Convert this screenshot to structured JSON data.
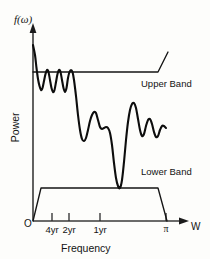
{
  "figure": {
    "background_color": "#fdfdfb",
    "ink_color": "#131313",
    "y_axis_label_top": "f(ω)",
    "y_axis_label": "Power",
    "x_axis_label": "Frequency",
    "x_axis_arrow_label": "W",
    "origin_label": "O"
  },
  "annotations": {
    "upper_band": "Upper Band",
    "lower_band": "Lower Band"
  },
  "chart_data": {
    "type": "line",
    "title": "",
    "subtitle": "",
    "xlabel": "Frequency",
    "ylabel": "Power",
    "y_axis_symbol": "f(ω)",
    "x_axis_symbol": "W",
    "grid": false,
    "legend_position": "inline-annotation",
    "xlim": [
      0,
      3.1416
    ],
    "ylim": [
      0,
      1
    ],
    "xticks": [
      {
        "label": "4yr",
        "x_px": 52
      },
      {
        "label": "2yr",
        "x_px": 69
      },
      {
        "label": "1yr",
        "x_px": 100
      },
      {
        "label": "π",
        "x_px": 166
      }
    ],
    "series": [
      {
        "name": "Power spectrum",
        "note": "Spectral density curve f(ω) with peaks at business-cycle frequencies",
        "points_px": [
          [
            33,
            45
          ],
          [
            35,
            55
          ],
          [
            36.5,
            68
          ],
          [
            38,
            79
          ],
          [
            39.5,
            86
          ],
          [
            41,
            90
          ],
          [
            42.5,
            88
          ],
          [
            44,
            81
          ],
          [
            45.5,
            74
          ],
          [
            47,
            70
          ],
          [
            48.5,
            72
          ],
          [
            50,
            80
          ],
          [
            51.5,
            88
          ],
          [
            53,
            92
          ],
          [
            54.5,
            90
          ],
          [
            56,
            82
          ],
          [
            57.5,
            74
          ],
          [
            59,
            70
          ],
          [
            60.5,
            72
          ],
          [
            62,
            80
          ],
          [
            63.5,
            88
          ],
          [
            65,
            92
          ],
          [
            66.5,
            88
          ],
          [
            68,
            78
          ],
          [
            69.5,
            72
          ],
          [
            71,
            70
          ],
          [
            72.5,
            72
          ],
          [
            74,
            80
          ],
          [
            76,
            96
          ],
          [
            78,
            115
          ],
          [
            80,
            130
          ],
          [
            82,
            139
          ],
          [
            84,
            141
          ],
          [
            86,
            138
          ],
          [
            88,
            130
          ],
          [
            90,
            121
          ],
          [
            92,
            115
          ],
          [
            94,
            112
          ],
          [
            96,
            113
          ],
          [
            98,
            120
          ],
          [
            100,
            127
          ],
          [
            102,
            129
          ],
          [
            104,
            128
          ],
          [
            106,
            127
          ],
          [
            108,
            128
          ],
          [
            110,
            133
          ],
          [
            112,
            145
          ],
          [
            114,
            163
          ],
          [
            116,
            178
          ],
          [
            118,
            186
          ],
          [
            120,
            188
          ],
          [
            122,
            180
          ],
          [
            124,
            162
          ],
          [
            126,
            140
          ],
          [
            128,
            122
          ],
          [
            130,
            110
          ],
          [
            132,
            104
          ],
          [
            134,
            103
          ],
          [
            136,
            108
          ],
          [
            138,
            119
          ],
          [
            140,
            130
          ],
          [
            142,
            136
          ],
          [
            144,
            134
          ],
          [
            146,
            126
          ],
          [
            148,
            120
          ],
          [
            150,
            119
          ],
          [
            152,
            124
          ],
          [
            154,
            132
          ],
          [
            156,
            137
          ],
          [
            158,
            136
          ],
          [
            160,
            130
          ],
          [
            162,
            126
          ],
          [
            164,
            126
          ],
          [
            166,
            128
          ]
        ]
      },
      {
        "name": "Upper Band",
        "note": "Upper confidence band: flat then rising near π",
        "points_px": [
          [
            33,
            72
          ],
          [
            158,
            72
          ],
          [
            168,
            52
          ]
        ]
      },
      {
        "name": "Lower Band",
        "note": "Lower confidence band: trapezoid rising from origin and falling at π",
        "points_px": [
          [
            33,
            221
          ],
          [
            41,
            188
          ],
          [
            158,
            188
          ],
          [
            167,
            221
          ]
        ]
      }
    ]
  }
}
